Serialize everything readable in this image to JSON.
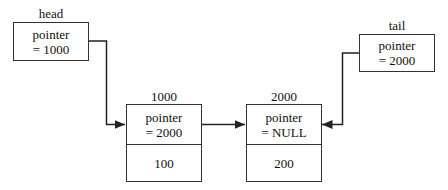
{
  "diagram": {
    "head": {
      "label": "head",
      "line1": "pointer",
      "line2": "= 1000"
    },
    "tail": {
      "label": "tail",
      "line1": "pointer",
      "line2": "= 2000"
    },
    "nodes": [
      {
        "address": "1000",
        "line1": "pointer",
        "line2": "= 2000",
        "value": "100"
      },
      {
        "address": "2000",
        "line1": "pointer",
        "line2": "= NULL",
        "value": "200"
      }
    ],
    "colors": {
      "line": "#222222",
      "border": "#333333"
    }
  }
}
